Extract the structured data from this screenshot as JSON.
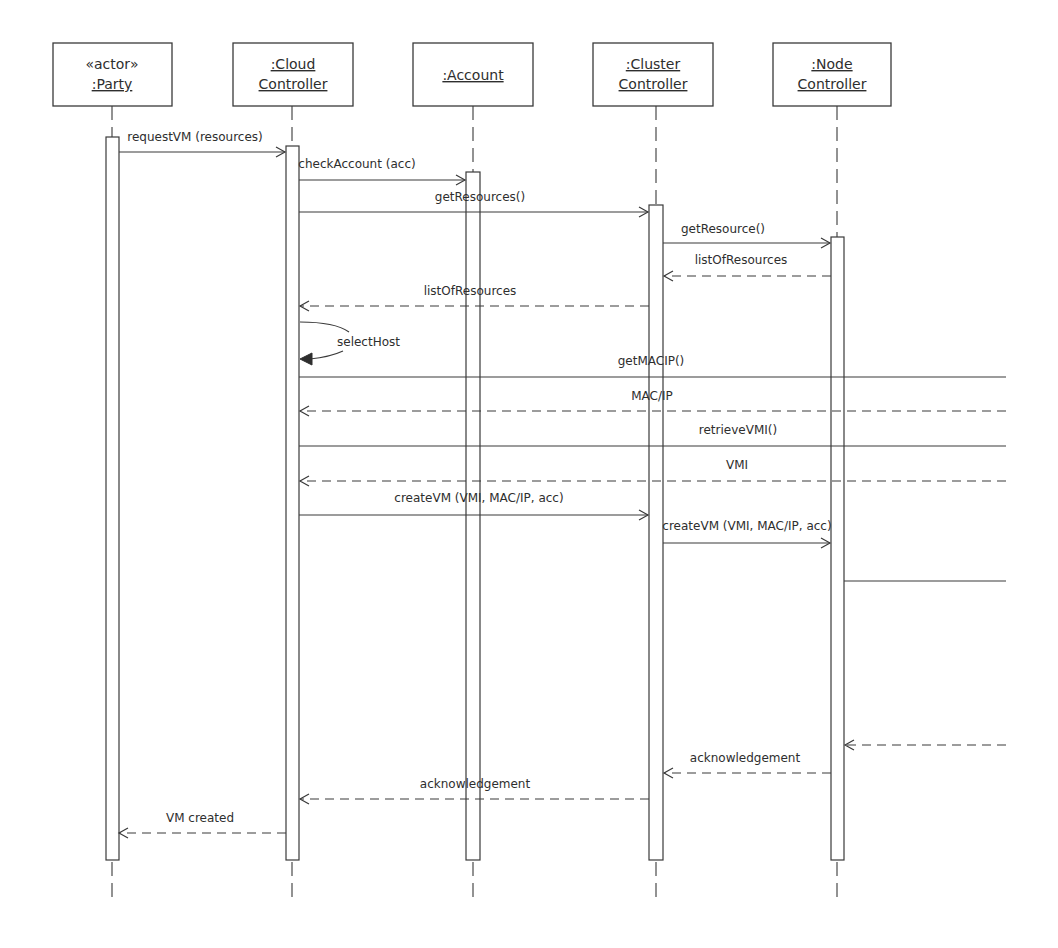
{
  "diagram": {
    "type": "UML sequence diagram",
    "lifelines": [
      {
        "id": "party",
        "stereotype": "«actor»",
        "line1": ":Party",
        "line2": "",
        "x": 112,
        "box": [
          53,
          43,
          119,
          63
        ]
      },
      {
        "id": "cloud",
        "stereotype": "",
        "line1": ":Cloud",
        "line2": "Controller",
        "x": 292,
        "box": [
          233,
          43,
          120,
          63
        ]
      },
      {
        "id": "account",
        "stereotype": "",
        "line1": ":Account",
        "line2": "",
        "x": 473,
        "box": [
          413,
          43,
          120,
          63
        ]
      },
      {
        "id": "cluster",
        "stereotype": "",
        "line1": ":Cluster",
        "line2": "Controller",
        "x": 656,
        "box": [
          593,
          43,
          120,
          63
        ]
      },
      {
        "id": "node",
        "stereotype": "",
        "line1": ":Node",
        "line2": "Controller",
        "x": 837,
        "box": [
          773,
          43,
          118,
          63
        ]
      }
    ],
    "messages": [
      {
        "label": "requestVM (resources)",
        "from": "party",
        "to": "cloud",
        "kind": "call",
        "y": 152
      },
      {
        "label": "checkAccount (acc)",
        "from": "cloud",
        "to": "account",
        "kind": "call",
        "y": 180
      },
      {
        "label": "getResources()",
        "from": "cloud",
        "to": "cluster",
        "kind": "call",
        "y": 212
      },
      {
        "label": "getResource()",
        "from": "cluster",
        "to": "node",
        "kind": "call",
        "y": 243
      },
      {
        "label": "listOfResources",
        "from": "node",
        "to": "cluster",
        "kind": "return",
        "y": 276
      },
      {
        "label": "listOfResources",
        "from": "cluster",
        "to": "cloud",
        "kind": "return",
        "y": 306
      },
      {
        "label": "selectHost",
        "from": "cloud",
        "to": "cloud",
        "kind": "self",
        "y": 322
      },
      {
        "label": "getMACIP()",
        "from": "cloud",
        "to": "offscreen",
        "kind": "call",
        "y": 377
      },
      {
        "label": "MAC/IP",
        "from": "offscreen",
        "to": "cloud",
        "kind": "return",
        "y": 411
      },
      {
        "label": "retrieveVMI()",
        "from": "cloud",
        "to": "offscreen",
        "kind": "call",
        "y": 446
      },
      {
        "label": "VMI",
        "from": "offscreen",
        "to": "cloud",
        "kind": "return",
        "y": 481
      },
      {
        "label": "createVM (VMI, MAC/IP, acc)",
        "from": "cloud",
        "to": "cluster",
        "kind": "call",
        "y": 515
      },
      {
        "label": "createVM (VMI, MAC/IP, acc)",
        "from": "cluster",
        "to": "node",
        "kind": "call",
        "y": 543
      },
      {
        "label": "",
        "from": "node",
        "to": "offscreen",
        "kind": "call",
        "y": 581
      },
      {
        "label": "",
        "from": "offscreen",
        "to": "node",
        "kind": "return",
        "y": 745
      },
      {
        "label": "acknowledgement",
        "from": "node",
        "to": "cluster",
        "kind": "return",
        "y": 773
      },
      {
        "label": "acknowledgement",
        "from": "cluster",
        "to": "cloud",
        "kind": "return",
        "y": 799
      },
      {
        "label": "VM created",
        "from": "cloud",
        "to": "party",
        "kind": "return",
        "y": 833
      }
    ]
  }
}
